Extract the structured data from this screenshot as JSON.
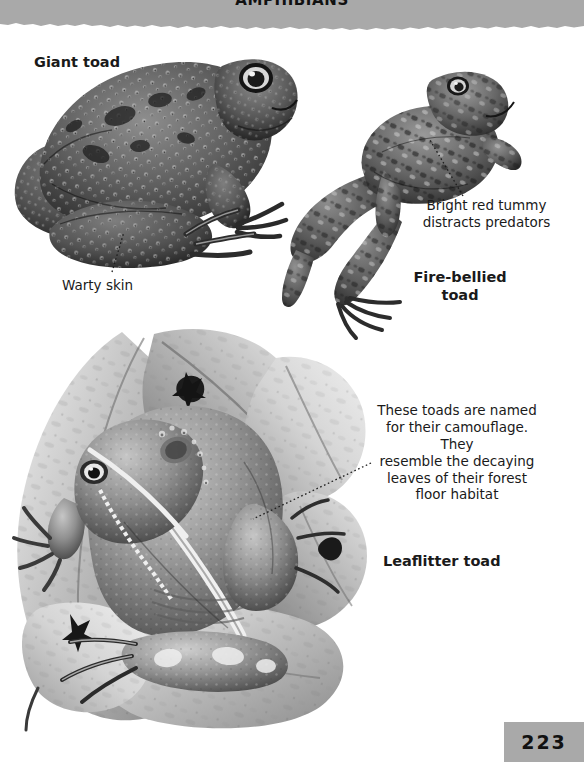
{
  "page": {
    "number": "223",
    "banner_title": "AMPHIBIANS",
    "background_color": "#ffffff",
    "banner_color": "#a9a9a9",
    "text_color": "#1a1a1a"
  },
  "labels": {
    "giant_toad": "Giant toad",
    "warty_skin": "Warty skin",
    "bright_red_tummy": "Bright red tummy\ndistracts predators",
    "fire_bellied_toad": "Fire-bellied\ntoad",
    "camouflage_caption": "These toads are named\nfor their camouflage. They\nresemble the decaying\nleaves of their forest\nfloor habitat",
    "leaflitter_toad": "Leaflitter toad"
  },
  "illustrations": {
    "giant_toad": "giant-toad-illustration",
    "fire_bellied_toad": "fire-bellied-toad-illustration",
    "leaflitter_toad": "leaflitter-toad-illustration"
  }
}
